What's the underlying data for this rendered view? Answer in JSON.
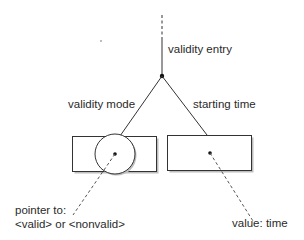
{
  "labels": {
    "root": "validity entry",
    "left_edge": "validity mode",
    "right_edge": "starting time",
    "left_pointer_line1": "pointer to:",
    "left_pointer_line2": "<valid> or <nonvalid>",
    "right_value": "value: time"
  },
  "colors": {
    "line": "#333333",
    "box_shadow": "#b5b5b5",
    "background": "#ffffff"
  }
}
